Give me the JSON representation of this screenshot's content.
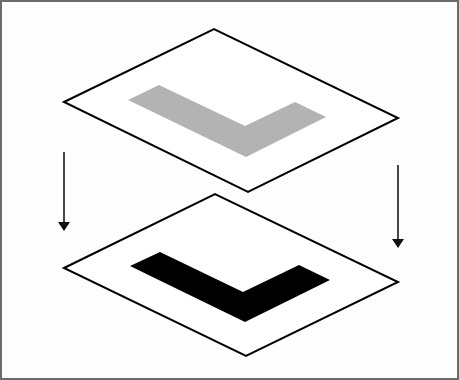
{
  "diagram": {
    "type": "layer-projection",
    "colors": {
      "frame_border": "#6b6b6b",
      "background": "#fdfdfd",
      "plane_fill": "#ffffff",
      "plane_stroke": "#000000",
      "top_shape_fill": "#b3b3b3",
      "bottom_shape_fill": "#000000",
      "arrow_color": "#333333"
    },
    "top_plane": {
      "points": "62,100 212,27 396,116 246,190",
      "shape_points": "126,98 157,83 243,124 293,100 324,115 244,155"
    },
    "bottom_plane": {
      "points": "62,266 213,192 396,280 244,354",
      "shape_points": "128,264 158,250 241,290 297,263 328,278 243,320"
    },
    "arrows": [
      {
        "name": "left",
        "x": 62,
        "y1": 150,
        "y2": 228
      },
      {
        "name": "right",
        "x": 396,
        "y1": 163,
        "y2": 245
      }
    ]
  }
}
